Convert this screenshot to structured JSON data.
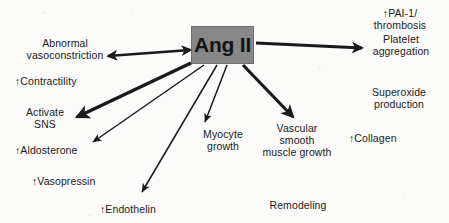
{
  "diagram": {
    "type": "radial-flow",
    "background_color": "#fbfbfa",
    "text_color": "#1a1a1a",
    "center": {
      "label": "Ang II",
      "fill_color": "#878787",
      "border_color": "#6e6e6e",
      "x": 191,
      "y": 26,
      "width": 63,
      "height": 38
    },
    "nodes": [
      {
        "id": "abnormal-vasoconstriction",
        "label": "Abnormal\nvasoconstriction",
        "x": 13,
        "y": 38,
        "width": 104,
        "align": "center"
      },
      {
        "id": "contractility",
        "label": "↑Contractility",
        "x": 15,
        "y": 76,
        "width": 90,
        "align": "left"
      },
      {
        "id": "activate-sns",
        "label": "Activate\nSNS",
        "x": 16,
        "y": 107,
        "width": 58,
        "align": "center"
      },
      {
        "id": "aldosterone",
        "label": "↑Aldosterone",
        "x": 15,
        "y": 145,
        "width": 90,
        "align": "left"
      },
      {
        "id": "vasopressin",
        "label": "↑Vasopressin",
        "x": 32,
        "y": 176,
        "width": 90,
        "align": "left"
      },
      {
        "id": "endothelin",
        "label": "↑Endothelin",
        "x": 100,
        "y": 204,
        "width": 84,
        "align": "left"
      },
      {
        "id": "myocyte-growth",
        "label": "Myocyte\ngrowth",
        "x": 195,
        "y": 129,
        "width": 56,
        "align": "center"
      },
      {
        "id": "vascular-smooth-muscle-growth",
        "label": "Vascular\nsmooth\nmuscle growth",
        "x": 256,
        "y": 123,
        "width": 82,
        "align": "center"
      },
      {
        "id": "remodeling",
        "label": "Remodeling",
        "x": 258,
        "y": 200,
        "width": 80,
        "align": "center"
      },
      {
        "id": "pai-1-thrombosis",
        "label": "↑PAI-1/\nthrombosis",
        "x": 362,
        "y": 8,
        "width": 76,
        "align": "center"
      },
      {
        "id": "platelet-aggregation",
        "label": "Platelet\naggregation",
        "x": 360,
        "y": 34,
        "width": 82,
        "align": "center"
      },
      {
        "id": "superoxide-production",
        "label": "Superoxide\nproduction",
        "x": 359,
        "y": 87,
        "width": 80,
        "align": "center"
      },
      {
        "id": "collagen",
        "label": "↑Collagen",
        "x": 349,
        "y": 133,
        "width": 72,
        "align": "left"
      }
    ],
    "arrows": [
      {
        "id": "arrow-to-abnormal-vasoconstriction",
        "from": "center",
        "to": "abnormal-vasoconstriction",
        "x1": 190,
        "y1": 50,
        "x2": 108,
        "y2": 56,
        "weight": 2.6,
        "head": "both",
        "color": "#1a1a1a"
      },
      {
        "id": "arrow-to-activate-sns",
        "from": "center",
        "to": "activate-sns",
        "x1": 191,
        "y1": 63,
        "x2": 77,
        "y2": 117,
        "weight": 3.4,
        "head": "end",
        "color": "#1a1a1a"
      },
      {
        "id": "arrow-to-aldosterone",
        "from": "center",
        "to": "aldosterone",
        "x1": 204,
        "y1": 65,
        "x2": 93,
        "y2": 142,
        "weight": 1.5,
        "head": "end",
        "color": "#1a1a1a"
      },
      {
        "id": "arrow-to-endothelin",
        "from": "center",
        "to": "endothelin",
        "x1": 217,
        "y1": 65,
        "x2": 142,
        "y2": 192,
        "weight": 1.5,
        "head": "end",
        "color": "#1a1a1a"
      },
      {
        "id": "arrow-to-myocyte-growth",
        "from": "center",
        "to": "myocyte-growth",
        "x1": 227,
        "y1": 65,
        "x2": 205,
        "y2": 122,
        "weight": 1.5,
        "head": "end",
        "color": "#1a1a1a"
      },
      {
        "id": "arrow-to-vascular-smooth-muscle-growth",
        "from": "center",
        "to": "vascular-smooth-muscle-growth",
        "x1": 243,
        "y1": 65,
        "x2": 293,
        "y2": 117,
        "weight": 3.2,
        "head": "end",
        "color": "#1a1a1a"
      },
      {
        "id": "arrow-to-platelet-aggregation",
        "from": "center",
        "to": "pai-1-thrombosis",
        "x1": 256,
        "y1": 43,
        "x2": 362,
        "y2": 48,
        "weight": 2.8,
        "head": "end",
        "color": "#1a1a1a"
      }
    ]
  }
}
